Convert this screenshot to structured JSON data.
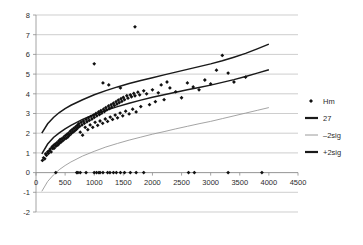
{
  "chart_data": {
    "type": "scatter",
    "title": "",
    "xlabel": "",
    "ylabel": "",
    "xlim": [
      0,
      4500
    ],
    "ylim": [
      -2,
      8
    ],
    "grid": true,
    "legend_position": "right",
    "xticks": [
      0,
      500,
      1000,
      1500,
      2000,
      2500,
      3000,
      3500,
      4000,
      4500
    ],
    "xtick_labels": [
      "0",
      "500",
      "1000",
      "1500",
      "2000",
      "2500",
      "3000",
      "3500",
      "4000",
      "4500"
    ],
    "yticks": [
      -2,
      -1,
      0,
      1,
      2,
      3,
      4,
      5,
      6,
      7,
      8
    ],
    "ytick_labels": [
      "-2",
      "-1",
      "0",
      "1",
      "2",
      "3",
      "4",
      "5",
      "6",
      "7",
      "8"
    ],
    "legend": [
      {
        "label": "Hm",
        "marker": "diamond",
        "color": "#111111",
        "kind": "scatter"
      },
      {
        "label": "27",
        "color": "#1a1a1a",
        "kind": "line",
        "width": "thick"
      },
      {
        "label": "–2sig",
        "color": "#9a9a9a",
        "kind": "line",
        "width": "thin"
      },
      {
        "label": "+2sig",
        "color": "#1a1a1a",
        "kind": "line",
        "width": "thick"
      }
    ],
    "series": [
      {
        "name": "Hm",
        "type": "scatter",
        "marker": "diamond",
        "color": "#111111",
        "points": [
          [
            110,
            0.62
          ],
          [
            130,
            0.75
          ],
          [
            150,
            0.7
          ],
          [
            165,
            0.95
          ],
          [
            180,
            0.88
          ],
          [
            200,
            1.05
          ],
          [
            215,
            0.98
          ],
          [
            230,
            1.12
          ],
          [
            245,
            1.2
          ],
          [
            260,
            1.05
          ],
          [
            275,
            1.3
          ],
          [
            290,
            1.22
          ],
          [
            300,
            1.38
          ],
          [
            315,
            1.25
          ],
          [
            330,
            1.45
          ],
          [
            345,
            1.35
          ],
          [
            360,
            1.52
          ],
          [
            375,
            1.4
          ],
          [
            390,
            1.6
          ],
          [
            400,
            1.48
          ],
          [
            415,
            1.68
          ],
          [
            430,
            1.55
          ],
          [
            445,
            1.72
          ],
          [
            460,
            1.62
          ],
          [
            475,
            1.8
          ],
          [
            490,
            1.7
          ],
          [
            505,
            1.88
          ],
          [
            520,
            1.75
          ],
          [
            535,
            1.95
          ],
          [
            550,
            1.82
          ],
          [
            560,
            2.0
          ],
          [
            575,
            1.9
          ],
          [
            590,
            2.1
          ],
          [
            605,
            1.98
          ],
          [
            620,
            2.18
          ],
          [
            635,
            2.05
          ],
          [
            650,
            2.25
          ],
          [
            665,
            2.12
          ],
          [
            680,
            2.32
          ],
          [
            695,
            2.2
          ],
          [
            710,
            2.4
          ],
          [
            720,
            2.28
          ],
          [
            735,
            2.48
          ],
          [
            750,
            2.35
          ],
          [
            760,
            2.05
          ],
          [
            775,
            2.55
          ],
          [
            790,
            2.42
          ],
          [
            800,
            1.9
          ],
          [
            815,
            2.62
          ],
          [
            830,
            2.5
          ],
          [
            845,
            2.3
          ],
          [
            860,
            2.7
          ],
          [
            875,
            2.58
          ],
          [
            890,
            2.18
          ],
          [
            900,
            2.78
          ],
          [
            915,
            2.65
          ],
          [
            930,
            2.42
          ],
          [
            945,
            2.85
          ],
          [
            960,
            2.72
          ],
          [
            975,
            2.3
          ],
          [
            990,
            2.92
          ],
          [
            1000,
            2.8
          ],
          [
            1015,
            2.55
          ],
          [
            1030,
            3.0
          ],
          [
            1045,
            2.88
          ],
          [
            1060,
            2.4
          ],
          [
            1075,
            3.08
          ],
          [
            1090,
            2.95
          ],
          [
            1100,
            2.62
          ],
          [
            1115,
            3.15
          ],
          [
            1130,
            3.02
          ],
          [
            1145,
            2.5
          ],
          [
            1160,
            3.22
          ],
          [
            1175,
            3.1
          ],
          [
            1190,
            2.72
          ],
          [
            1200,
            3.3
          ],
          [
            1215,
            3.18
          ],
          [
            1230,
            2.6
          ],
          [
            1245,
            3.38
          ],
          [
            1260,
            3.25
          ],
          [
            1275,
            2.82
          ],
          [
            1290,
            3.45
          ],
          [
            1300,
            3.32
          ],
          [
            1315,
            2.7
          ],
          [
            1330,
            3.52
          ],
          [
            1345,
            3.4
          ],
          [
            1360,
            2.92
          ],
          [
            1375,
            3.6
          ],
          [
            1390,
            3.48
          ],
          [
            1400,
            2.78
          ],
          [
            1415,
            3.68
          ],
          [
            1430,
            3.55
          ],
          [
            1445,
            3.02
          ],
          [
            1460,
            3.75
          ],
          [
            1475,
            3.62
          ],
          [
            1490,
            2.88
          ],
          [
            1500,
            3.82
          ],
          [
            1520,
            3.7
          ],
          [
            1540,
            3.12
          ],
          [
            1560,
            3.9
          ],
          [
            1580,
            3.78
          ],
          [
            1600,
            2.98
          ],
          [
            1620,
            3.95
          ],
          [
            1640,
            3.85
          ],
          [
            1660,
            3.22
          ],
          [
            1680,
            4.02
          ],
          [
            1700,
            3.9
          ],
          [
            1720,
            3.08
          ],
          [
            1750,
            4.08
          ],
          [
            1780,
            3.95
          ],
          [
            1800,
            3.35
          ],
          [
            1850,
            4.15
          ],
          [
            1900,
            4.0
          ],
          [
            1950,
            3.45
          ],
          [
            2000,
            4.2
          ],
          [
            2050,
            3.6
          ],
          [
            2100,
            4.05
          ],
          [
            2200,
            3.7
          ],
          [
            2300,
            4.3
          ],
          [
            2400,
            4.1
          ],
          [
            2500,
            3.8
          ],
          [
            2600,
            4.55
          ],
          [
            2700,
            4.35
          ],
          [
            2800,
            4.2
          ],
          [
            2900,
            4.7
          ],
          [
            3000,
            4.5
          ],
          [
            3100,
            5.2
          ],
          [
            3200,
            5.95
          ],
          [
            3300,
            5.05
          ],
          [
            3400,
            4.6
          ],
          [
            3600,
            4.85
          ],
          [
            1700,
            7.4
          ],
          [
            1000,
            5.52
          ],
          [
            1250,
            4.45
          ],
          [
            1150,
            4.55
          ],
          [
            1450,
            4.3
          ],
          [
            2150,
            4.45
          ],
          [
            2250,
            4.6
          ],
          [
            340,
            0.0
          ],
          [
            700,
            0.0
          ],
          [
            720,
            0.0
          ],
          [
            760,
            0.0
          ],
          [
            860,
            0.0
          ],
          [
            1000,
            0.0
          ],
          [
            1040,
            0.0
          ],
          [
            1080,
            0.0
          ],
          [
            1100,
            0.0
          ],
          [
            1150,
            0.0
          ],
          [
            1230,
            0.0
          ],
          [
            1270,
            0.0
          ],
          [
            1330,
            0.0
          ],
          [
            1380,
            0.0
          ],
          [
            1450,
            0.0
          ],
          [
            1520,
            0.0
          ],
          [
            1620,
            0.0
          ],
          [
            1720,
            0.0
          ],
          [
            1850,
            0.0
          ],
          [
            2620,
            0.0
          ],
          [
            2720,
            0.0
          ],
          [
            3300,
            0.0
          ],
          [
            3880,
            0.0
          ]
        ]
      },
      {
        "name": "27",
        "type": "line",
        "color": "#1a1a1a",
        "width": "thick",
        "points": [
          [
            100,
            0.95
          ],
          [
            200,
            1.45
          ],
          [
            300,
            1.78
          ],
          [
            400,
            2.02
          ],
          [
            500,
            2.22
          ],
          [
            600,
            2.4
          ],
          [
            800,
            2.7
          ],
          [
            1000,
            2.95
          ],
          [
            1200,
            3.16
          ],
          [
            1400,
            3.35
          ],
          [
            1600,
            3.52
          ],
          [
            1800,
            3.68
          ],
          [
            2000,
            3.82
          ],
          [
            2200,
            3.95
          ],
          [
            2400,
            4.08
          ],
          [
            2600,
            4.2
          ],
          [
            2800,
            4.32
          ],
          [
            3000,
            4.44
          ],
          [
            3200,
            4.58
          ],
          [
            3400,
            4.72
          ],
          [
            3600,
            4.88
          ],
          [
            3800,
            5.05
          ],
          [
            4000,
            5.22
          ]
        ]
      },
      {
        "name": "+2sig",
        "type": "line",
        "color": "#1a1a1a",
        "width": "thick",
        "points": [
          [
            100,
            2.0
          ],
          [
            200,
            2.48
          ],
          [
            300,
            2.8
          ],
          [
            400,
            3.05
          ],
          [
            500,
            3.25
          ],
          [
            600,
            3.42
          ],
          [
            800,
            3.7
          ],
          [
            1000,
            3.95
          ],
          [
            1200,
            4.16
          ],
          [
            1400,
            4.35
          ],
          [
            1600,
            4.52
          ],
          [
            1800,
            4.68
          ],
          [
            2000,
            4.82
          ],
          [
            2200,
            4.96
          ],
          [
            2400,
            5.1
          ],
          [
            2600,
            5.24
          ],
          [
            2800,
            5.38
          ],
          [
            3000,
            5.52
          ],
          [
            3200,
            5.68
          ],
          [
            3400,
            5.86
          ],
          [
            3600,
            6.05
          ],
          [
            3800,
            6.28
          ],
          [
            4000,
            6.52
          ]
        ]
      },
      {
        "name": "–2sig",
        "type": "line",
        "color": "#9a9a9a",
        "width": "thin",
        "points": [
          [
            100,
            -0.95
          ],
          [
            200,
            -0.45
          ],
          [
            300,
            -0.12
          ],
          [
            400,
            0.15
          ],
          [
            500,
            0.36
          ],
          [
            600,
            0.54
          ],
          [
            800,
            0.84
          ],
          [
            1000,
            1.08
          ],
          [
            1200,
            1.3
          ],
          [
            1400,
            1.48
          ],
          [
            1600,
            1.65
          ],
          [
            1800,
            1.8
          ],
          [
            2000,
            1.95
          ],
          [
            2200,
            2.08
          ],
          [
            2400,
            2.22
          ],
          [
            2600,
            2.35
          ],
          [
            2800,
            2.48
          ],
          [
            3000,
            2.6
          ],
          [
            3200,
            2.74
          ],
          [
            3400,
            2.88
          ],
          [
            3600,
            3.02
          ],
          [
            3800,
            3.16
          ],
          [
            4000,
            3.3
          ]
        ]
      }
    ]
  }
}
